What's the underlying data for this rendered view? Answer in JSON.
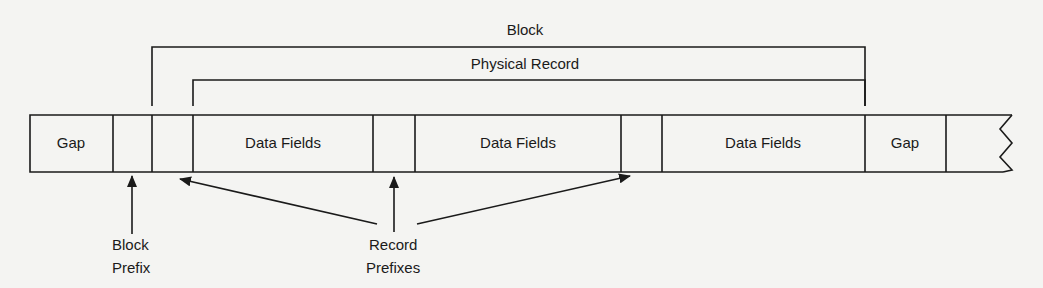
{
  "diagram": {
    "title_labels": {
      "block": "Block",
      "physical_record": "Physical Record"
    },
    "segments": [
      {
        "id": "gap-1",
        "label": "Gap"
      },
      {
        "id": "block-prefix",
        "label": ""
      },
      {
        "id": "record-prefix-1",
        "label": ""
      },
      {
        "id": "data-fields-1",
        "label": "Data Fields"
      },
      {
        "id": "record-prefix-2",
        "label": ""
      },
      {
        "id": "data-fields-2",
        "label": "Data Fields"
      },
      {
        "id": "record-prefix-3",
        "label": ""
      },
      {
        "id": "data-fields-3",
        "label": "Data Fields"
      },
      {
        "id": "gap-2",
        "label": "Gap"
      },
      {
        "id": "continuation",
        "label": ""
      }
    ],
    "annotations": {
      "block_prefix": [
        "Block",
        "Prefix"
      ],
      "record_prefixes": [
        "Record",
        "Prefixes"
      ]
    },
    "colors": {
      "line": "#1a1a1a",
      "background": "#f4f4f2"
    }
  }
}
